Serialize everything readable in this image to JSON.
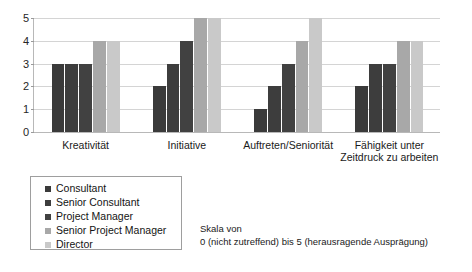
{
  "chart_data": {
    "type": "bar",
    "title": "",
    "xlabel": "",
    "ylabel": "",
    "ylim": [
      0,
      5
    ],
    "yticks": [
      "0",
      "1",
      "2",
      "3",
      "4",
      "5"
    ],
    "grid": true,
    "legend_position": "below-left",
    "categories": [
      "Kreativität",
      "Initiative",
      "Auftreten/Seniorität",
      "Fähigkeit unter\nZeitdruck zu arbeiten"
    ],
    "series": [
      {
        "name": "Consultant",
        "color": "#3a3a3a",
        "values": [
          3,
          2,
          1,
          2
        ]
      },
      {
        "name": "Senior Consultant",
        "color": "#3d3d3d",
        "values": [
          3,
          3,
          2,
          3
        ]
      },
      {
        "name": "Project Manager",
        "color": "#414141",
        "values": [
          3,
          4,
          3,
          3
        ]
      },
      {
        "name": "Senior Project Manager",
        "color": "#a8a8a8",
        "values": [
          4,
          5,
          4,
          4
        ]
      },
      {
        "name": "Director",
        "color": "#c9c9c9",
        "values": [
          4,
          5,
          5,
          4
        ]
      }
    ],
    "annotation": "Skala von\n0 (nicht zutreffend) bis 5 (herausragende Ausprägung)"
  }
}
